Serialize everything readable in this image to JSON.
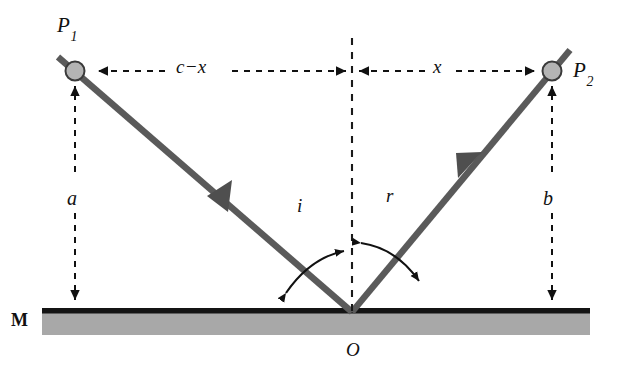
{
  "figure": {
    "background_color": "#ffffff",
    "ray_color": "#5a5a5a",
    "mirror_surface_color": "#111111",
    "mirror_body_color": "#a8a8a8",
    "node_fill_color": "#b4b4b4",
    "node_stroke_color": "#3a3a3a",
    "dashed_line_color": "#1a1a1a",
    "arc_color": "#111111"
  },
  "labels": {
    "point_p1": {
      "text": "P",
      "subscript": "1"
    },
    "point_p2": {
      "text": "P",
      "subscript": "2"
    },
    "segment_c_minus_x": "c−x",
    "segment_x": "x",
    "height_a": "a",
    "height_b": "b",
    "angle_incidence": "i",
    "angle_reflection": "r",
    "mirror": "M",
    "origin": "O"
  },
  "geometry": {
    "p1": {
      "x": 75,
      "y": 71
    },
    "p2": {
      "x": 552,
      "y": 71
    },
    "origin_o": {
      "x": 352,
      "y": 312
    },
    "normal_top_y": 38,
    "mirror_left_x": 42,
    "mirror_right_x": 590,
    "mirror_surface_y": 312,
    "mirror_thickness": 22,
    "horizontal_dimension_y": 71
  }
}
